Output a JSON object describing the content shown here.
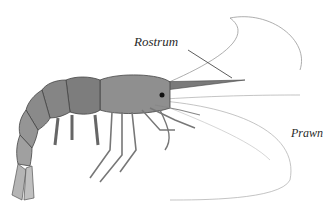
{
  "illustration": {
    "subject": "prawn",
    "labels": {
      "rostrum": "Rostrum",
      "species": "Prawn"
    },
    "colors": {
      "body_dark": "#4a4a4a",
      "body_mid": "#8a8a8a",
      "body_light": "#c8c8c8",
      "line": "#555555"
    }
  }
}
